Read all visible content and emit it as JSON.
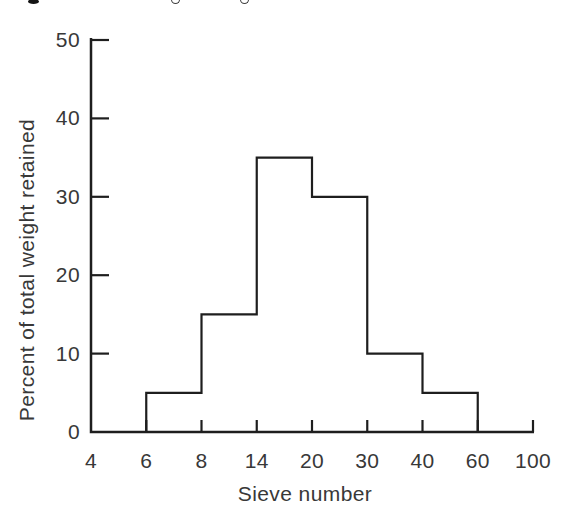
{
  "figure": {
    "top_edge_fragments": {
      "description": "bottoms of cut-off caption glyph descenders at top edge of scan",
      "items": [
        {
          "style": "bold-dot",
          "x": 28
        },
        {
          "style": "open-ring",
          "x": 171
        },
        {
          "style": "open-ring",
          "x": 240
        }
      ]
    }
  },
  "chart_data": {
    "type": "bar",
    "subtype": "histogram-outline",
    "title": "",
    "xlabel": "Sieve number",
    "ylabel": "Percent of total weight retained",
    "x_tick_labels": [
      "4",
      "6",
      "8",
      "14",
      "20",
      "30",
      "40",
      "60",
      "100"
    ],
    "y_ticks": [
      0,
      10,
      20,
      30,
      40,
      50
    ],
    "ylim": [
      0,
      50
    ],
    "x_axis_note": "sieve numbers evenly spaced (categorical/log-style axis)",
    "bars": [
      {
        "from": "6",
        "to": "8",
        "value": 5
      },
      {
        "from": "8",
        "to": "14",
        "value": 15
      },
      {
        "from": "14",
        "to": "20",
        "value": 35
      },
      {
        "from": "20",
        "to": "30",
        "value": 30
      },
      {
        "from": "30",
        "to": "40",
        "value": 10
      },
      {
        "from": "40",
        "to": "60",
        "value": 5
      }
    ],
    "grid": false,
    "legend": false,
    "style": {
      "line_color": "#1e1e1e",
      "text_color": "#383838",
      "background": "#ffffff",
      "bar_fill": "none"
    }
  }
}
